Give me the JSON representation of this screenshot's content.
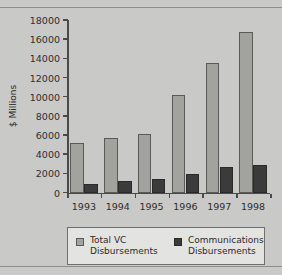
{
  "chart_data": {
    "type": "bar",
    "title": "",
    "subtitle": "",
    "xlabel": "",
    "ylabel": "$ Millions",
    "categories": [
      "1993",
      "1994",
      "1995",
      "1996",
      "1997",
      "1998"
    ],
    "series": [
      {
        "name": "Total VC Disbursements",
        "legend_line1": "Total VC",
        "legend_line2": "Disbursements",
        "color": "#a2a29e",
        "values": [
          5200,
          5700,
          6100,
          10200,
          13500,
          16700
        ]
      },
      {
        "name": "Communications Disbursements",
        "legend_line1": "Communications",
        "legend_line2": "Disbursements",
        "color": "#3b3b3b",
        "values": [
          850,
          1150,
          1400,
          1950,
          2700,
          2900
        ]
      }
    ],
    "ylim": [
      0,
      18000
    ],
    "yticks": [
      0,
      2000,
      4000,
      6000,
      8000,
      10000,
      12000,
      14000,
      16000,
      18000
    ],
    "ytick_labels": [
      "0",
      "2000",
      "4000",
      "6000",
      "8000",
      "10000",
      "12000",
      "14000",
      "16000",
      "18000"
    ],
    "grid": false,
    "legend_position": "bottom",
    "background_color": "#c9c9c7",
    "axis_color": "#4a4a4a"
  }
}
